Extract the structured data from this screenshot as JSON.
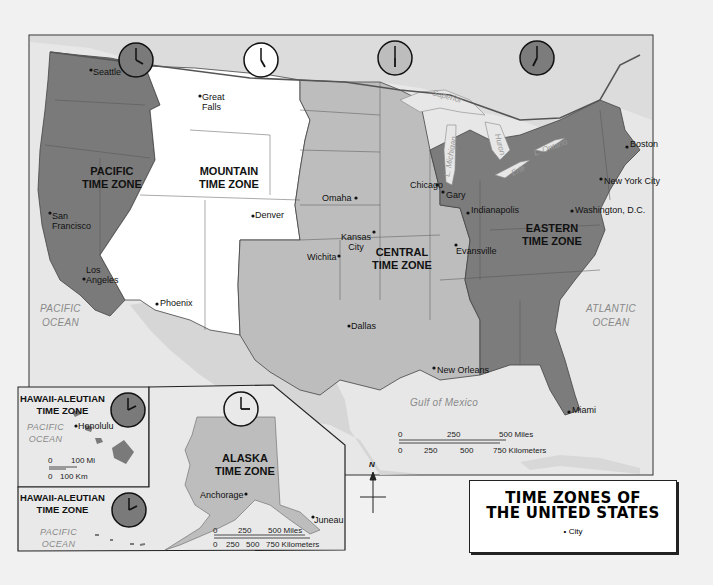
{
  "title": {
    "line1": "TIME ZONES OF",
    "line2": "THE UNITED STATES"
  },
  "legend": {
    "city_symbol": "•",
    "city_label": "City"
  },
  "colors": {
    "pacific_zone": "#7a7a7a",
    "mountain_zone": "#ffffff",
    "central_zone": "#bdbdbd",
    "eastern_zone": "#7c7c7c",
    "alaska_zone": "#bdbdbd",
    "hawaii_zone": "#7a7a7a",
    "water": "#e7e7e7",
    "foreign_land": "#d9d9d9",
    "page": "#f1f1f1"
  },
  "time_zones": [
    {
      "name": "PACIFIC TIME ZONE",
      "line1": "PACIFIC",
      "line2": "TIME ZONE",
      "clock_time": "4:00"
    },
    {
      "name": "MOUNTAIN TIME ZONE",
      "line1": "MOUNTAIN",
      "line2": "TIME ZONE",
      "clock_time": "5:00"
    },
    {
      "name": "CENTRAL TIME ZONE",
      "line1": "CENTRAL",
      "line2": "TIME ZONE",
      "clock_time": "6:00"
    },
    {
      "name": "EASTERN TIME ZONE",
      "line1": "EASTERN",
      "line2": "TIME ZONE",
      "clock_time": "7:00"
    },
    {
      "name": "ALASKA TIME ZONE",
      "line1": "ALASKA",
      "line2": "TIME ZONE",
      "clock_time": "3:00"
    },
    {
      "name": "HAWAII-ALEUTIAN TIME ZONE",
      "line1": "HAWAII-ALEUTIAN",
      "line2": "TIME ZONE",
      "clock_time": "2:00"
    }
  ],
  "cities": {
    "seattle": "Seattle",
    "great_falls_1": "Great",
    "great_falls_2": "Falls",
    "san_francisco_1": "San",
    "san_francisco_2": "Francisco",
    "los_angeles_1": "Los",
    "los_angeles_2": "Angeles",
    "phoenix": "Phoenix",
    "denver": "Denver",
    "omaha": "Omaha",
    "kansas_city_1": "Kansas",
    "kansas_city_2": "City",
    "wichita": "Wichita",
    "dallas": "Dallas",
    "chicago": "Chicago",
    "gary": "Gary",
    "indianapolis": "Indianapolis",
    "evansville": "Evansville",
    "new_orleans": "New Orleans",
    "boston": "Boston",
    "new_york_city": "New York City",
    "washington_dc": "Washington, D.C.",
    "miami": "Miami",
    "honolulu": "Honolulu",
    "anchorage": "Anchorage",
    "juneau": "Juneau"
  },
  "water_labels": {
    "pacific_1": "PACIFIC",
    "pacific_2": "OCEAN",
    "atlantic_1": "ATLANTIC",
    "atlantic_2": "OCEAN",
    "gulf": "Gulf of Mexico",
    "superior": "Superior",
    "michigan": "L. Michigan",
    "huron": "Huron",
    "erie": "Erie",
    "ontario": "L. Ontario"
  },
  "scales": {
    "main_miles": [
      "0",
      "250",
      "500 Miles"
    ],
    "main_km": [
      "0",
      "250",
      "500",
      "750 Kilometers"
    ],
    "hawaii_mi": [
      "0",
      "100 Mi"
    ],
    "hawaii_km": [
      "0",
      "100 Km"
    ],
    "alaska_miles": [
      "0",
      "250",
      "500 Miles"
    ],
    "alaska_km": [
      "0",
      "250",
      "500",
      "750 Kilometers"
    ]
  },
  "compass": {
    "north": "N"
  }
}
